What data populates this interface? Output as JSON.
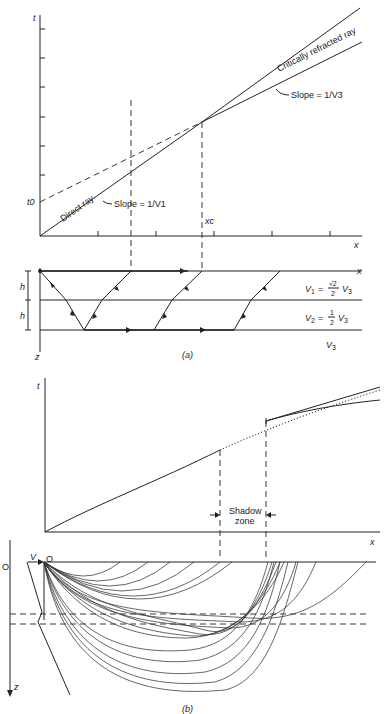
{
  "header": {
    "running_title": "SEISMIC METHODS"
  },
  "panel_a": {
    "caption": "(a)",
    "graph": {
      "y_axis_label": "t",
      "x_axis_label": "x",
      "intercept_label": "t0",
      "crossover_label": "xc",
      "direct_ray_label": "Direct ray",
      "refracted_ray_label": "Critically refracted ray",
      "slope_v1_label": "Slope = 1/V1",
      "slope_v3_label": "Slope = 1/V3"
    },
    "section": {
      "x_label": "x",
      "z_label": "z",
      "thickness_labels": [
        "h",
        "h"
      ],
      "layers": [
        {
          "label": "V1 = (√2/2) V3"
        },
        {
          "label": "V2 = (1/2) V3"
        },
        {
          "label": "V3"
        }
      ]
    }
  },
  "panel_b": {
    "caption": "(b)",
    "graph": {
      "y_axis_label": "t",
      "x_axis_label": "x",
      "shadow_zone_label": [
        "Shadow",
        "zone"
      ]
    },
    "section": {
      "origin_label_left": "O",
      "origin_label_source": "O",
      "velocity_label": "V",
      "z_label": "z"
    }
  }
}
